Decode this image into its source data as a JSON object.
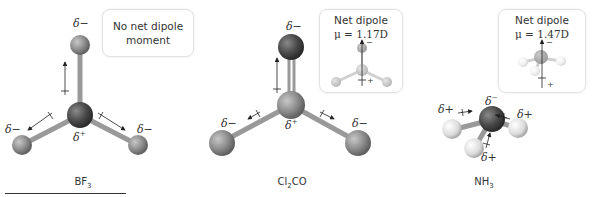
{
  "molecules": [
    {
      "formula": "BF3",
      "formula_base": "BF",
      "formula_sub": "3",
      "formula_suffix": "",
      "box_text_line1": "No net dipole",
      "box_text_line2": "moment",
      "central_charge": "δ",
      "central_charge_sign": "+",
      "outer_charges": [
        "δ−",
        "δ−",
        "δ−"
      ]
    },
    {
      "formula": "Cl2CO",
      "formula_base": "Cl",
      "formula_sub": "2",
      "formula_suffix": "CO",
      "box_text_line1": "Net dipole",
      "box_text_line2": "μ = 1.17D",
      "central_charge": "δ",
      "central_charge_sign": "+",
      "outer_charges": [
        "δ−",
        "δ−",
        "δ−"
      ]
    },
    {
      "formula": "NH3",
      "formula_base": "NH",
      "formula_sub": "3",
      "formula_suffix": "",
      "box_text_line1": "Net dipole",
      "box_text_line2": "μ = 1.47D",
      "central_charge": "δ",
      "central_charge_sign": "−",
      "outer_charges": [
        "δ+",
        "δ+",
        "δ+"
      ]
    }
  ],
  "symbols": {
    "delta": "δ",
    "minus": "−",
    "plus": "+"
  }
}
